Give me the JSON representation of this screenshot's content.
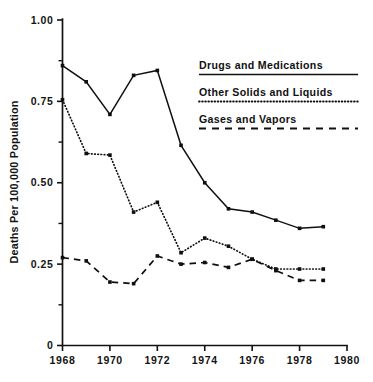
{
  "chart_data": {
    "type": "line",
    "title": "",
    "xlabel": "",
    "ylabel": "Deaths Per 100,000 Population",
    "x": [
      1968,
      1969,
      1970,
      1971,
      1972,
      1973,
      1974,
      1975,
      1976,
      1977,
      1978,
      1979
    ],
    "xlim": [
      1968,
      1980
    ],
    "ylim": [
      0,
      1.0
    ],
    "grid": false,
    "legend_position": "upper-right",
    "x_tick_labels": [
      "1968",
      "1970",
      "1972",
      "1974",
      "1976",
      "1978",
      "1980"
    ],
    "x_tick_values": [
      1968,
      1970,
      1972,
      1974,
      1976,
      1978,
      1980
    ],
    "y_tick_labels": [
      "1.00",
      "0.75",
      "0.50",
      "0.25",
      "0"
    ],
    "y_tick_values": [
      1.0,
      0.75,
      0.5,
      0.25,
      0
    ],
    "y_minor_ticks": [
      0.875,
      0.625,
      0.375,
      0.125
    ],
    "series": [
      {
        "name": "Drugs and Medications",
        "style": "solid",
        "values": [
          0.86,
          0.81,
          0.71,
          0.83,
          0.845,
          0.615,
          0.5,
          0.42,
          0.41,
          0.385,
          0.36,
          0.365
        ]
      },
      {
        "name": "Other Solids and Liquids",
        "style": "dotted",
        "values": [
          0.755,
          0.59,
          0.585,
          0.41,
          0.44,
          0.285,
          0.33,
          0.305,
          0.265,
          0.235,
          0.235,
          0.235
        ]
      },
      {
        "name": "Gases and Vapors",
        "style": "dashed",
        "values": [
          0.27,
          0.26,
          0.195,
          0.19,
          0.275,
          0.25,
          0.255,
          0.24,
          0.265,
          0.23,
          0.2,
          0.2
        ]
      }
    ]
  },
  "axes": {
    "y_label": "Deaths Per 100,000 Population",
    "y_ticks": [
      "1.00",
      "0.75",
      "0.50",
      "0.25",
      "0"
    ],
    "x_ticks": [
      "1968",
      "1970",
      "1972",
      "1974",
      "1976",
      "1978",
      "1980"
    ]
  },
  "legend": {
    "entries": [
      {
        "label": "Drugs and Medications",
        "style": "solid"
      },
      {
        "label": "Other Solids and Liquids",
        "style": "dotted"
      },
      {
        "label": "Gases and Vapors",
        "style": "dashed"
      }
    ]
  },
  "colors": {
    "ink": "#111111",
    "background": "#ffffff"
  }
}
